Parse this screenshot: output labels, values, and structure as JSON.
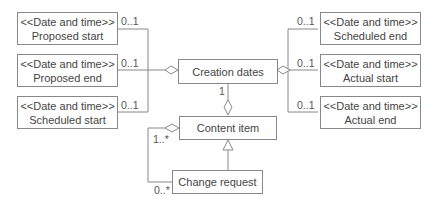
{
  "diagram": {
    "stereotype": "<<Date and time>>",
    "left_boxes": [
      {
        "stereotype": "<<Date and time>>",
        "name": "Proposed start",
        "multiplicity": "0..1"
      },
      {
        "stereotype": "<<Date and time>>",
        "name": "Proposed end",
        "multiplicity": "0..1"
      },
      {
        "stereotype": "<<Date and time>>",
        "name": "Scheduled start",
        "multiplicity": "0..1"
      }
    ],
    "right_boxes": [
      {
        "stereotype": "<<Date and time>>",
        "name": "Scheduled end",
        "multiplicity": "0..1"
      },
      {
        "stereotype": "<<Date and time>>",
        "name": "Actual start",
        "multiplicity": "0..1"
      },
      {
        "stereotype": "<<Date and time>>",
        "name": "Actual end",
        "multiplicity": "0..1"
      }
    ],
    "creation_dates": {
      "name": "Creation dates",
      "multiplicity": "1"
    },
    "content_item": {
      "name": "Content item",
      "multiplicity": "1..*"
    },
    "change_request": {
      "name": "Change request",
      "multiplicity": "0..*"
    },
    "colors": {
      "line": "#888888",
      "text": "#444444"
    }
  }
}
